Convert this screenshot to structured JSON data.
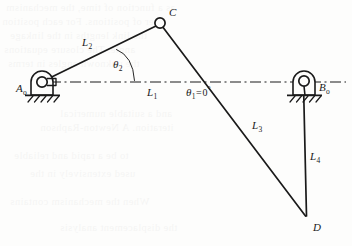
{
  "figure": {
    "kind": "four-bar-linkage-kinematic-diagram",
    "canvas": {
      "width": 352,
      "height": 246
    },
    "background_color": "#fdfdfc",
    "ink_color": "#1a1a1a"
  },
  "joints": [
    {
      "id": "A0",
      "label": "A",
      "sub": "o",
      "type": "grounded-pivot",
      "x": 42,
      "y": 82,
      "label_x": 16,
      "label_y": 84
    },
    {
      "id": "C",
      "label": "C",
      "sub": "",
      "type": "pin-joint",
      "x": 160,
      "y": 23,
      "label_x": 169,
      "label_y": 7
    },
    {
      "id": "B0",
      "label": "B",
      "sub": "o",
      "type": "grounded-pivot",
      "x": 304,
      "y": 82,
      "label_x": 319,
      "label_y": 83
    },
    {
      "id": "D",
      "label": "D",
      "sub": "",
      "type": "pin-joint",
      "x": 306,
      "y": 217,
      "label_x": 314,
      "label_y": 223
    }
  ],
  "links": [
    {
      "id": "L1",
      "label": "L",
      "sub": "1",
      "from": "A0",
      "to": "B0",
      "style": "dash-dot-centerline",
      "label_x": 147,
      "label_y": 88
    },
    {
      "id": "L2",
      "label": "L",
      "sub": "2",
      "from": "A0",
      "to": "C",
      "style": "solid",
      "label_x": 82,
      "label_y": 38
    },
    {
      "id": "L3",
      "label": "L",
      "sub": "3",
      "from": "C",
      "to": "D",
      "style": "solid",
      "label_x": 253,
      "label_y": 121
    },
    {
      "id": "L4",
      "label": "L",
      "sub": "4",
      "from": "B0",
      "to": "D",
      "style": "solid",
      "label_x": 311,
      "label_y": 152
    }
  ],
  "angles": [
    {
      "id": "theta2",
      "symbol": "θ",
      "sub": "2",
      "value": "",
      "measured_from": "L1",
      "measured_to": "L2",
      "label_x": 113,
      "label_y": 60,
      "arc": {
        "start_x": 116,
        "start_y": 49,
        "end_x": 134,
        "end_y": 80
      }
    },
    {
      "id": "theta1",
      "symbol": "θ",
      "sub": "1",
      "equals": "=",
      "value": "0",
      "unit": "°",
      "measured_from": "ground",
      "measured_to": "L1",
      "label_x": 186,
      "label_y": 88
    }
  ],
  "ground_supports": [
    {
      "for": "A0",
      "base_y": 95,
      "base_x1": 26,
      "base_x2": 59,
      "hatch_count": 5
    },
    {
      "for": "B0",
      "base_y": 95,
      "base_x1": 288,
      "base_x2": 321,
      "hatch_count": 5
    }
  ],
  "centerline": {
    "y": 82,
    "x_start": 50,
    "x_end": 346,
    "dash_pattern": "11,3.5,2,3.5"
  },
  "bleed_through_text": [
    "as a function of time, the mechanism",
    "ber of positions. For each position",
    "the link lengths in the linkage",
    "angle. The closure equations",
    "the unknown angles in terms",
    "and a suitable numerical",
    "iteration. A Newton-Raphson",
    "to be a rapid and reliable",
    "used extensively in the",
    "When the mechanism contains",
    "the displacement analysis"
  ]
}
